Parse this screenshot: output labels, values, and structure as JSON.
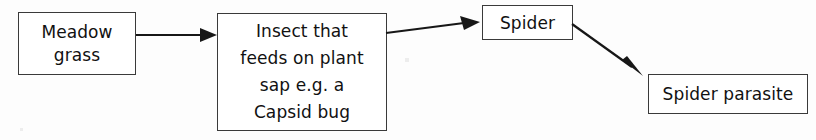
{
  "diagram": {
    "background_color": "#fdfdfd",
    "line_color": "#171717",
    "text_color": "#111111",
    "nodes": [
      {
        "id": "meadow-grass",
        "lines": [
          "Meadow",
          "grass"
        ]
      },
      {
        "id": "insect",
        "lines": [
          "Insect that",
          "feeds on plant",
          "sap e.g. a",
          "Capsid bug"
        ]
      },
      {
        "id": "spider",
        "lines": [
          "Spider"
        ]
      },
      {
        "id": "spider-parasite",
        "lines": [
          "Spider parasite"
        ]
      }
    ],
    "edges": [
      {
        "id": "grass-to-insect",
        "from": "meadow-grass",
        "to": "insect",
        "style": "straight-arrow"
      },
      {
        "id": "insect-to-spider",
        "from": "insect",
        "to": "spider",
        "style": "straight-arrow-up"
      },
      {
        "id": "spider-to-parasite",
        "from": "spider",
        "to": "spider-parasite",
        "style": "diagonal-arrow-down"
      }
    ]
  }
}
